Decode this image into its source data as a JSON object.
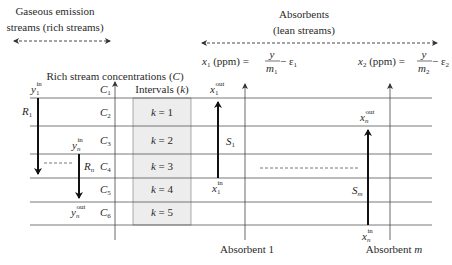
{
  "header": {
    "rich_title_line1": "Gaseous emission",
    "rich_title_line2": "streams (rich streams)",
    "lean_title_line1": "Absorbents",
    "lean_title_line2": "(lean streams)"
  },
  "axes": {
    "rich_axis_label_main": "Rich stream concentrations (",
    "rich_axis_label_var": "C",
    "rich_axis_label_close": ")",
    "absorbent1_label": "Absorbent 1",
    "absorbentm_label_main": "Absorbent ",
    "absorbentm_label_var": "m"
  },
  "equations": {
    "eq1": {
      "lhs_var": "x",
      "lhs_sub": "1",
      "unit": " (ppm) = ",
      "num": "y",
      "den_var": "m",
      "den_sub": "1",
      "minus": " − ε",
      "eps_sub": "1"
    },
    "eq2": {
      "lhs_var": "x",
      "lhs_sub": "2",
      "unit": " (ppm) = ",
      "num": "y",
      "den_var": "m",
      "den_sub": "2",
      "minus": " − ε",
      "eps_sub": "2"
    }
  },
  "concentrations": [
    {
      "var": "C",
      "sub": "1"
    },
    {
      "var": "C",
      "sub": "2"
    },
    {
      "var": "C",
      "sub": "3"
    },
    {
      "var": "C",
      "sub": "4"
    },
    {
      "var": "C",
      "sub": "5"
    },
    {
      "var": "C",
      "sub": "6"
    }
  ],
  "intervals": {
    "header_main": "Intervals (",
    "header_var": "k",
    "header_close": ")",
    "rows": [
      {
        "var": "k",
        "eq": " = 1"
      },
      {
        "var": "k",
        "eq": " = 2"
      },
      {
        "var": "k",
        "eq": " = 3"
      },
      {
        "var": "k",
        "eq": " = 4"
      },
      {
        "var": "k",
        "eq": " = 5"
      }
    ]
  },
  "rich_streams": [
    {
      "name_var": "R",
      "name_sub": "1",
      "in_var": "y",
      "in_sub": "1",
      "in_sup": "in"
    },
    {
      "name_var": "R",
      "name_sub": "n",
      "in_var": "y",
      "in_sub": "n",
      "in_sup": "in",
      "out_var": "y",
      "out_sub": "n",
      "out_sup": "out"
    }
  ],
  "lean_streams": [
    {
      "name_var": "S",
      "name_sub": "1",
      "in_var": "x",
      "in_sub": "1",
      "in_sup": "in",
      "out_var": "x",
      "out_sub": "1",
      "out_sup": "out"
    },
    {
      "name_var": "S",
      "name_sub": "m",
      "in_var": "x",
      "in_sub": "n",
      "in_sup": "in",
      "out_var": "x",
      "out_sub": "n",
      "out_sup": "out"
    }
  ],
  "colors": {
    "line": "#555555",
    "arrow": "#111111",
    "interval_fill": "#ededed",
    "text": "#2a2a2a"
  }
}
